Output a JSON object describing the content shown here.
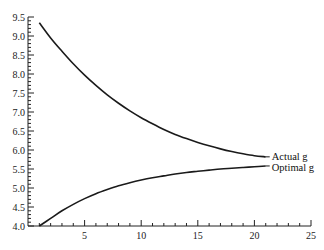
{
  "chart_data": {
    "type": "line",
    "title": "",
    "xlabel": "",
    "ylabel": "",
    "xlim": [
      0,
      25
    ],
    "ylim": [
      4.0,
      9.5
    ],
    "grid": false,
    "legend_position": "inline-right",
    "x_ticks": [
      5,
      10,
      15,
      20,
      25
    ],
    "x_tick_labels": [
      "5",
      "10",
      "15",
      "20",
      "25"
    ],
    "x_minor_step": 1,
    "y_ticks": [
      4.0,
      4.5,
      5.0,
      5.5,
      6.0,
      6.5,
      7.0,
      7.5,
      8.0,
      8.5,
      9.0,
      9.5
    ],
    "y_tick_labels": [
      "4.0",
      "4.5",
      "5.0",
      "5.5",
      "6.0",
      "6.5",
      "7.0",
      "7.5",
      "8.0",
      "8.5",
      "9.0",
      "9.5"
    ],
    "y_minor_step": 0.1,
    "series": [
      {
        "name": "Actual g",
        "x": [
          1,
          2,
          3,
          4,
          5,
          6,
          7,
          8,
          9,
          10,
          11,
          12,
          13,
          14,
          15,
          16,
          17,
          18,
          19,
          20,
          21
        ],
        "y": [
          9.35,
          8.95,
          8.6,
          8.27,
          7.97,
          7.7,
          7.45,
          7.23,
          7.03,
          6.85,
          6.69,
          6.54,
          6.41,
          6.3,
          6.2,
          6.11,
          6.03,
          5.96,
          5.9,
          5.85,
          5.82
        ]
      },
      {
        "name": "Optimal g",
        "x": [
          1,
          2,
          3,
          4,
          5,
          6,
          7,
          8,
          9,
          10,
          11,
          12,
          13,
          14,
          15,
          16,
          17,
          18,
          19,
          20,
          21
        ],
        "y": [
          4.0,
          4.2,
          4.4,
          4.57,
          4.72,
          4.85,
          4.96,
          5.06,
          5.14,
          5.21,
          5.27,
          5.32,
          5.37,
          5.41,
          5.44,
          5.47,
          5.5,
          5.52,
          5.54,
          5.56,
          5.58
        ]
      }
    ]
  },
  "legend": {
    "actual_label": "Actual g",
    "optimal_label": "Optimal g"
  }
}
